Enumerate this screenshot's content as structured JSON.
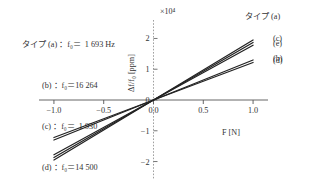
{
  "chart_data": {
    "type": "line",
    "title": "",
    "xlabel": "F [N]",
    "ylabel": "Δf/f₀ [ppm]",
    "y_exponent_label": "×10⁴",
    "xlim": [
      -1.15,
      1.15
    ],
    "ylim": [
      -2.6,
      2.6
    ],
    "xticks": [
      "-1.0",
      "-0.5",
      "0.0",
      "0.5",
      "1.0"
    ],
    "xtick_values": [
      -1.0,
      -0.5,
      0.0,
      0.5,
      1.0
    ],
    "yticks": [
      "2",
      "1",
      "0",
      "-1",
      "-2"
    ],
    "ytick_values": [
      2,
      1,
      0,
      -1,
      -2
    ],
    "grid": false,
    "legend_position": "upper-left",
    "series": [
      {
        "name": "(a)",
        "slope": 1.87,
        "x": [
          -1.0,
          1.0
        ],
        "y": [
          -1.87,
          1.87
        ],
        "color": "#222222"
      },
      {
        "name": "(b)",
        "slope": 1.3,
        "x": [
          -1.0,
          1.0
        ],
        "y": [
          -1.3,
          1.3
        ],
        "color": "#222222"
      },
      {
        "name": "(c)",
        "slope": 1.95,
        "x": [
          -1.0,
          1.0
        ],
        "y": [
          -1.95,
          1.95
        ],
        "color": "#222222"
      },
      {
        "name": "(d)",
        "slope": 1.22,
        "x": [
          -1.0,
          1.0
        ],
        "y": [
          -1.22,
          1.22
        ],
        "color": "#222222"
      },
      {
        "name": "(e)",
        "slope": 1.78,
        "x": [
          -1.0,
          1.0
        ],
        "y": [
          -1.78,
          1.78
        ],
        "color": "#222222"
      }
    ]
  },
  "legend": {
    "lines": [
      "タイプ (a) ：f₀＝  1 693 Hz",
      "(b) ：f₀＝16 264",
      "(c) ：f₀＝  1 930",
      "(d) ：f₀＝14 500",
      "(e) ：f₀＝  1 788"
    ]
  },
  "annotations": {
    "top_right": "タイプ (a)",
    "right_labels": [
      "(c)",
      "(e)",
      "(b)",
      "(d)"
    ]
  },
  "axes": {
    "x_label": "F [N]",
    "y_label": "Δf/f₀ [ppm]",
    "exponent": "×10⁴"
  }
}
